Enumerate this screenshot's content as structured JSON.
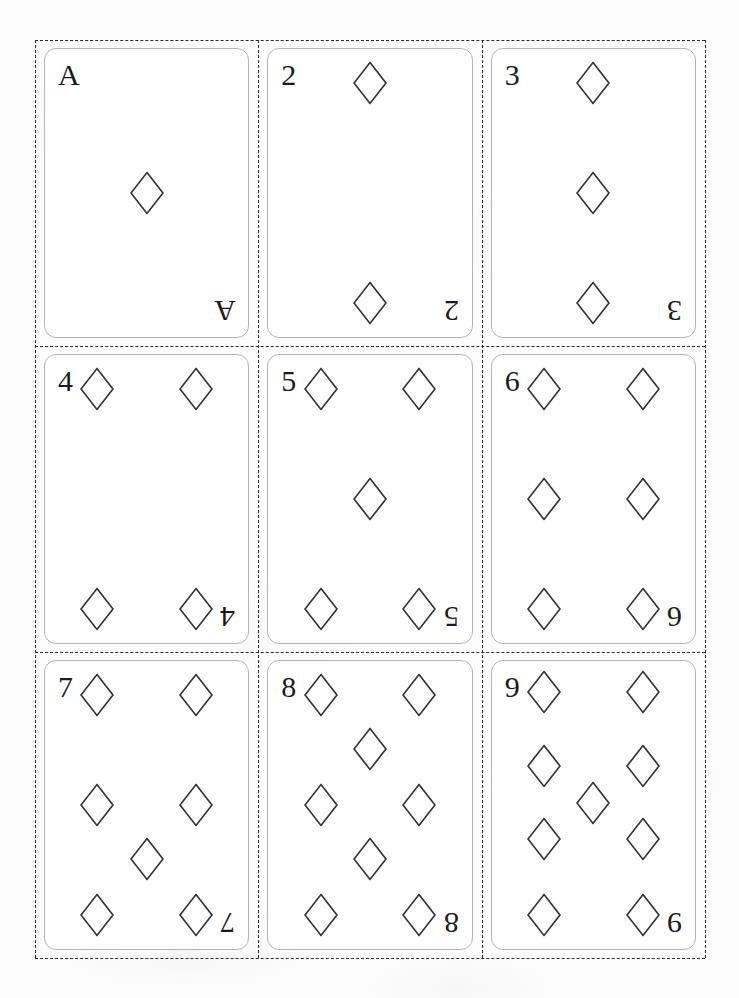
{
  "sheet": {
    "title": "Printable Playing Cards Sheet",
    "suit_name": "diamonds",
    "suit_symbol": "diamond",
    "columns": 3,
    "rows": 3,
    "card_count": 9,
    "cut_lines": "dashed",
    "page_background": "#fdfdfd",
    "card_background": "#ffffff",
    "card_border_color": "#b4b4b4",
    "pip_stroke_color": "#333338",
    "pip_fill_color": "#ffffff",
    "index_color": "#1b1b1b"
  },
  "cards": [
    {
      "rank": "A",
      "index_top_left": "A",
      "index_bottom_right": "A",
      "pip_count": 1,
      "pips": [
        {
          "x": 50,
          "y": 50
        }
      ]
    },
    {
      "rank": "2",
      "index_top_left": "2",
      "index_bottom_right": "2",
      "pip_count": 2,
      "pips": [
        {
          "x": 50,
          "y": 5
        },
        {
          "x": 50,
          "y": 95
        }
      ]
    },
    {
      "rank": "3",
      "index_top_left": "3",
      "index_bottom_right": "3",
      "pip_count": 3,
      "pips": [
        {
          "x": 50,
          "y": 5
        },
        {
          "x": 50,
          "y": 50
        },
        {
          "x": 50,
          "y": 95
        }
      ]
    },
    {
      "rank": "4",
      "index_top_left": "4",
      "index_bottom_right": "4",
      "pip_count": 4,
      "pips": [
        {
          "x": 18,
          "y": 5
        },
        {
          "x": 82,
          "y": 5
        },
        {
          "x": 18,
          "y": 95
        },
        {
          "x": 82,
          "y": 95
        }
      ]
    },
    {
      "rank": "5",
      "index_top_left": "5",
      "index_bottom_right": "5",
      "pip_count": 5,
      "pips": [
        {
          "x": 18,
          "y": 5
        },
        {
          "x": 82,
          "y": 5
        },
        {
          "x": 50,
          "y": 50
        },
        {
          "x": 18,
          "y": 95
        },
        {
          "x": 82,
          "y": 95
        }
      ]
    },
    {
      "rank": "6",
      "index_top_left": "6",
      "index_bottom_right": "6",
      "pip_count": 6,
      "pips": [
        {
          "x": 18,
          "y": 5
        },
        {
          "x": 82,
          "y": 5
        },
        {
          "x": 18,
          "y": 50
        },
        {
          "x": 82,
          "y": 50
        },
        {
          "x": 18,
          "y": 95
        },
        {
          "x": 82,
          "y": 95
        }
      ]
    },
    {
      "rank": "7",
      "index_top_left": "7",
      "index_bottom_right": "7",
      "pip_count": 7,
      "pips": [
        {
          "x": 18,
          "y": 5
        },
        {
          "x": 82,
          "y": 5
        },
        {
          "x": 18,
          "y": 50
        },
        {
          "x": 82,
          "y": 50
        },
        {
          "x": 50,
          "y": 72
        },
        {
          "x": 18,
          "y": 95
        },
        {
          "x": 82,
          "y": 95
        }
      ]
    },
    {
      "rank": "8",
      "index_top_left": "8",
      "index_bottom_right": "8",
      "pip_count": 8,
      "pips": [
        {
          "x": 18,
          "y": 5
        },
        {
          "x": 82,
          "y": 5
        },
        {
          "x": 50,
          "y": 27
        },
        {
          "x": 18,
          "y": 50
        },
        {
          "x": 82,
          "y": 50
        },
        {
          "x": 50,
          "y": 72
        },
        {
          "x": 18,
          "y": 95
        },
        {
          "x": 82,
          "y": 95
        }
      ]
    },
    {
      "rank": "9",
      "index_top_left": "9",
      "index_bottom_right": "9",
      "pip_count": 9,
      "pips": [
        {
          "x": 18,
          "y": 4
        },
        {
          "x": 82,
          "y": 4
        },
        {
          "x": 18,
          "y": 34
        },
        {
          "x": 82,
          "y": 34
        },
        {
          "x": 50,
          "y": 49
        },
        {
          "x": 18,
          "y": 64
        },
        {
          "x": 82,
          "y": 64
        },
        {
          "x": 18,
          "y": 95
        },
        {
          "x": 82,
          "y": 95
        }
      ]
    }
  ]
}
